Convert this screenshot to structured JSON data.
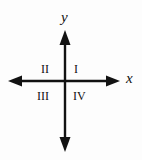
{
  "figure": {
    "kind": "cartesian-coordinate-plane-quadrant-diagram",
    "background_color": "#fdfdfd",
    "ink_color": "#121212"
  },
  "axes": {
    "x": {
      "label": "x",
      "style": "italic",
      "arrow_both_ends": true,
      "start_x": 8,
      "end_x": 120,
      "y": 81
    },
    "y": {
      "label": "y",
      "style": "italic",
      "arrow_both_ends": true,
      "start_y": 30,
      "end_y": 152,
      "x": 65
    },
    "origin": {
      "x": 65,
      "y": 81
    },
    "line_width": 2
  },
  "quadrants": [
    {
      "name": "quadrant-1",
      "label": "I"
    },
    {
      "name": "quadrant-2",
      "label": "II"
    },
    {
      "name": "quadrant-3",
      "label": "III"
    },
    {
      "name": "quadrant-4",
      "label": "IV"
    }
  ]
}
